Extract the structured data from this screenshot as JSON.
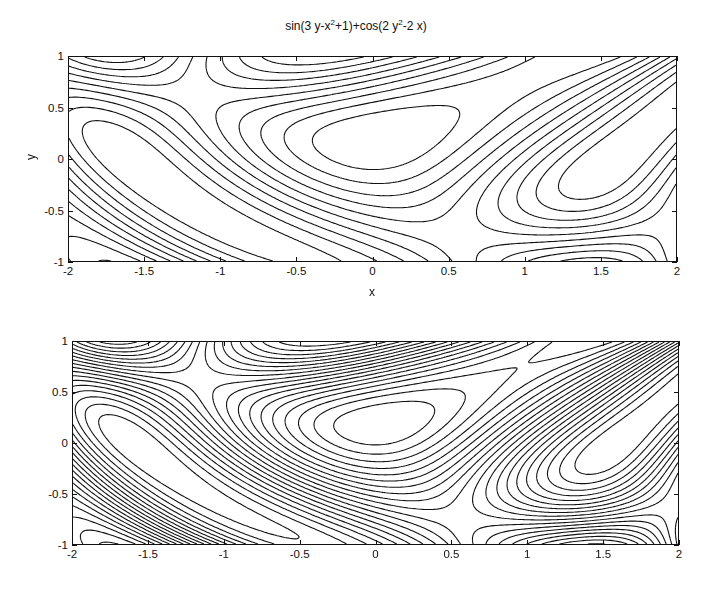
{
  "chart_data": [
    {
      "type": "contour",
      "title": "sin(3 y-x^2+1)+cos(2 y^2-2 x)",
      "title_parts": {
        "a": "sin(3 y-x",
        "b": "2",
        "c": "+1)+cos(2 y",
        "d": "2",
        "e": "-2 x)"
      },
      "function": "sin(3*y - x^2 + 1) + cos(2*y^2 - 2*x)",
      "xlabel": "x",
      "ylabel": "y",
      "xlim": [
        -2,
        2
      ],
      "ylim": [
        -1,
        1
      ],
      "xticks": [
        "-2",
        "-1.5",
        "-1",
        "-0.5",
        "0",
        "0.5",
        "1",
        "1.5",
        "2"
      ],
      "yticks": [
        "-1",
        "-0.5",
        "0",
        "0.5",
        "1"
      ],
      "num_levels": 10,
      "grid": false
    },
    {
      "type": "contour",
      "title": "",
      "function": "sin(3*y - x^2 + 1) + cos(2*y^2 - 2*x)",
      "xlabel": "",
      "ylabel": "",
      "xlim": [
        -2,
        2
      ],
      "ylim": [
        -1,
        1
      ],
      "xticks": [
        "-2",
        "-1.5",
        "-1",
        "-0.5",
        "0",
        "0.5",
        "1",
        "1.5",
        "2"
      ],
      "yticks": [
        "-1",
        "-0.5",
        "0",
        "0.5",
        "1"
      ],
      "num_levels": 20,
      "grid": false
    }
  ]
}
